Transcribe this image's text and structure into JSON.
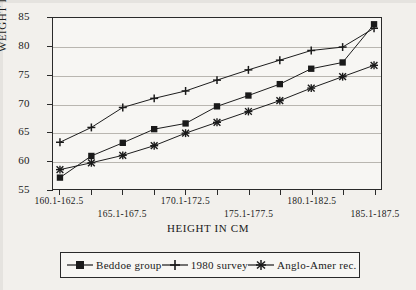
{
  "chart_data": {
    "type": "line",
    "title": "",
    "xlabel": "HEIGHT IN CM",
    "ylabel": "WEIGHT IN KG",
    "ylim": [
      55,
      85
    ],
    "ytick_labels": [
      "85",
      "80",
      "75",
      "70",
      "65",
      "60",
      "55"
    ],
    "yticks": [
      85,
      80,
      75,
      70,
      65,
      60,
      55
    ],
    "grid": true,
    "legend_position": "bottom",
    "categories": [
      "160.1-162.5",
      "162.6-165.0",
      "165.1-167.5",
      "167.6-170.0",
      "170.1-172.5",
      "172.6-175.0",
      "175.1-177.5",
      "177.6-180.0",
      "180.1-182.5",
      "182.6-185.0",
      "185.1-187.5"
    ],
    "xtick_labels_visible": [
      "160.1-162.5",
      "165.1-167.5",
      "170.1-172.5",
      "175.1-177.5",
      "180.1-182.5",
      "185.1-187.5"
    ],
    "series": [
      {
        "name": "Beddoe group",
        "marker": "square",
        "values": [
          57.0,
          60.8,
          63.1,
          65.5,
          66.5,
          69.5,
          71.4,
          73.4,
          76.1,
          77.2,
          83.9
        ]
      },
      {
        "name": "1980 survey",
        "marker": "plus",
        "values": [
          63.2,
          65.8,
          69.3,
          70.9,
          72.2,
          74.1,
          75.9,
          77.6,
          79.3,
          79.9,
          83.2
        ]
      },
      {
        "name": "Anglo-Amer rec.",
        "marker": "asterisk",
        "values": [
          58.4,
          59.6,
          60.9,
          62.6,
          64.8,
          66.7,
          68.6,
          70.5,
          72.7,
          74.7,
          76.7
        ]
      }
    ]
  },
  "axes": {
    "y_title": "WEIGHT IN KG",
    "x_title": "HEIGHT IN CM"
  },
  "legend": {
    "items": [
      {
        "label": "Beddoe group",
        "marker": "square-marker-icon"
      },
      {
        "label": "1980 survey",
        "marker": "plus-marker-icon"
      },
      {
        "label": "Anglo-Amer rec.",
        "marker": "asterisk-marker-icon"
      }
    ]
  },
  "colors": {
    "ink": "#1a1a1a",
    "grid": "#b9b6b0",
    "paper": "#f2f0ec",
    "plot_bg": "#f7f6f3"
  }
}
